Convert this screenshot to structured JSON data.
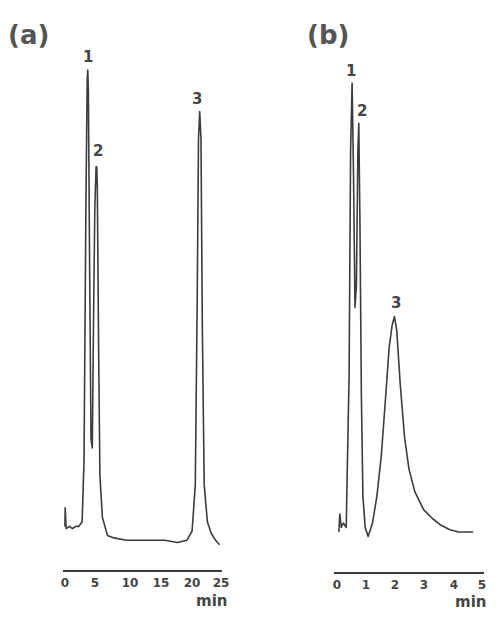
{
  "chart_data": [
    {
      "type": "line",
      "panel": "(a)",
      "title": "",
      "xlabel": "min",
      "ylabel": "",
      "x_ticks": [
        0,
        5,
        10,
        15,
        20,
        25
      ],
      "xlim": [
        0,
        25
      ],
      "grid": false,
      "legend": null,
      "peaks": [
        {
          "label": "1",
          "retention_min": 3.9,
          "relative_height": 1.0
        },
        {
          "label": "2",
          "retention_min": 5.3,
          "relative_height": 0.79
        },
        {
          "label": "3",
          "retention_min": 21.5,
          "relative_height": 0.91
        }
      ],
      "trace": {
        "x": [
          0.3,
          0.35,
          0.5,
          1.0,
          1.5,
          2.0,
          2.5,
          3.0,
          3.3,
          3.6,
          3.8,
          3.9,
          4.0,
          4.2,
          4.4,
          4.6,
          4.8,
          5.0,
          5.2,
          5.3,
          5.4,
          5.6,
          5.8,
          6.2,
          7.0,
          8.0,
          10.0,
          12.0,
          14.0,
          16.0,
          18.0,
          19.5,
          20.3,
          20.8,
          21.1,
          21.3,
          21.5,
          21.7,
          21.9,
          22.2,
          22.7,
          23.3,
          24.0,
          24.6
        ],
        "y": [
          0.01,
          0.05,
          0.005,
          0.01,
          0.005,
          0.01,
          0.01,
          0.02,
          0.15,
          0.7,
          0.98,
          1.0,
          0.95,
          0.55,
          0.2,
          0.18,
          0.45,
          0.7,
          0.79,
          0.79,
          0.75,
          0.4,
          0.12,
          0.03,
          -0.01,
          -0.015,
          -0.02,
          -0.02,
          -0.02,
          -0.02,
          -0.025,
          -0.02,
          0.0,
          0.1,
          0.5,
          0.85,
          0.91,
          0.85,
          0.45,
          0.1,
          0.02,
          -0.005,
          -0.02,
          -0.03
        ]
      }
    },
    {
      "type": "line",
      "panel": "(b)",
      "title": "",
      "xlabel": "min",
      "ylabel": "",
      "x_ticks": [
        0,
        1,
        2,
        3,
        4,
        5
      ],
      "xlim": [
        0,
        5
      ],
      "grid": false,
      "legend": null,
      "peaks": [
        {
          "label": "1",
          "retention_min": 0.55,
          "relative_height": 1.0
        },
        {
          "label": "2",
          "retention_min": 0.78,
          "relative_height": 0.91
        },
        {
          "label": "3",
          "retention_min": 2.0,
          "relative_height": 0.48
        }
      ],
      "trace": {
        "x": [
          0.1,
          0.13,
          0.18,
          0.25,
          0.35,
          0.45,
          0.5,
          0.55,
          0.6,
          0.65,
          0.7,
          0.75,
          0.78,
          0.82,
          0.87,
          0.92,
          1.0,
          1.1,
          1.25,
          1.4,
          1.55,
          1.7,
          1.82,
          1.92,
          2.0,
          2.08,
          2.2,
          2.35,
          2.5,
          2.7,
          3.0,
          3.3,
          3.6,
          3.9,
          4.2,
          4.5,
          4.7
        ],
        "y": [
          0.0,
          0.04,
          0.01,
          0.02,
          0.01,
          0.35,
          0.85,
          1.0,
          0.8,
          0.5,
          0.55,
          0.85,
          0.91,
          0.7,
          0.3,
          0.08,
          0.01,
          -0.01,
          0.02,
          0.08,
          0.17,
          0.3,
          0.41,
          0.46,
          0.48,
          0.45,
          0.33,
          0.21,
          0.14,
          0.09,
          0.05,
          0.03,
          0.015,
          0.005,
          0.0,
          0.0,
          0.0
        ]
      }
    }
  ],
  "panels": {
    "a": {
      "label": "(a)",
      "peak_labels": [
        "1",
        "2",
        "3"
      ],
      "tick_labels": [
        "0",
        "5",
        "10",
        "15",
        "20",
        "25"
      ],
      "unit": "min"
    },
    "b": {
      "label": "(b)",
      "peak_labels": [
        "1",
        "2",
        "3"
      ],
      "tick_labels": [
        "0",
        "1",
        "2",
        "3",
        "4",
        "5"
      ],
      "unit": "min"
    }
  }
}
